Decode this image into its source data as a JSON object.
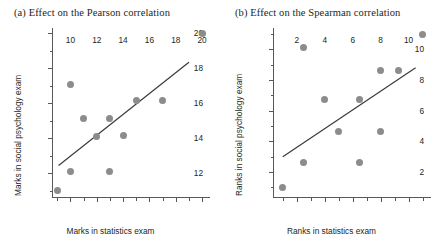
{
  "figure": {
    "background": "#ffffff",
    "point_color": "#8c8c8c",
    "axis_color": "#58595b",
    "line_color": "#3b3b3b"
  },
  "chart_data": [
    {
      "type": "scatter",
      "panel": "a",
      "title": "(a) Effect on the Pearson correlation",
      "xlabel": "Marks in statistics exam",
      "ylabel": "Marks in social psychology exam",
      "xlim": [
        8.6,
        20.6
      ],
      "ylim": [
        10.6,
        20.3
      ],
      "xticks": [
        10,
        12,
        14,
        16,
        18,
        20
      ],
      "xticklabels": [
        "10",
        "12",
        "14",
        "16",
        "18",
        "20"
      ],
      "yticks": [
        12,
        14,
        16,
        18,
        20
      ],
      "yticklabels": [
        "12",
        "14",
        "16",
        "18",
        "20"
      ],
      "x_minor_ticks": [
        9,
        11,
        13,
        15,
        17,
        19
      ],
      "y_minor_ticks": [
        11,
        13,
        15,
        17,
        19
      ],
      "grid": false,
      "legend": false,
      "points": [
        {
          "x": 9,
          "y": 11.0
        },
        {
          "x": 10,
          "y": 12.1
        },
        {
          "x": 10,
          "y": 17.1
        },
        {
          "x": 11,
          "y": 15.15
        },
        {
          "x": 12,
          "y": 14.1
        },
        {
          "x": 13,
          "y": 15.15
        },
        {
          "x": 13,
          "y": 12.1
        },
        {
          "x": 14,
          "y": 14.15
        },
        {
          "x": 15,
          "y": 16.15
        },
        {
          "x": 17,
          "y": 16.15
        },
        {
          "x": 20,
          "y": 20.0
        }
      ],
      "fit_line": {
        "x1": 9.1,
        "y1": 12.45,
        "x2": 19.0,
        "y2": 18.35
      }
    },
    {
      "type": "scatter",
      "panel": "b",
      "title": "(b) Effect on the Spearman correlation",
      "xlabel": "Ranks in statistics exam",
      "ylabel": "Ranks in social psychology exam",
      "xlim": [
        0.3,
        11.6
      ],
      "ylim": [
        0.3,
        11.4
      ],
      "xticks": [
        2,
        4,
        6,
        8,
        10
      ],
      "xticklabels": [
        "2",
        "4",
        "6",
        "8",
        "10"
      ],
      "yticks": [
        2,
        4,
        6,
        8,
        10
      ],
      "yticklabels": [
        "2",
        "4",
        "6",
        "8",
        "10"
      ],
      "x_minor_ticks": [
        1,
        3,
        5,
        7,
        9,
        11
      ],
      "y_minor_ticks": [
        1,
        3,
        5,
        7,
        9,
        11
      ],
      "grid": false,
      "legend": false,
      "points": [
        {
          "x": 1.0,
          "y": 1.0
        },
        {
          "x": 2.5,
          "y": 2.65
        },
        {
          "x": 2.5,
          "y": 10.1
        },
        {
          "x": 4.0,
          "y": 6.7
        },
        {
          "x": 5.0,
          "y": 4.65
        },
        {
          "x": 6.5,
          "y": 6.7
        },
        {
          "x": 6.5,
          "y": 2.65
        },
        {
          "x": 8.0,
          "y": 4.65
        },
        {
          "x": 8.0,
          "y": 8.65
        },
        {
          "x": 9.3,
          "y": 8.65
        },
        {
          "x": 11.0,
          "y": 11.0
        }
      ],
      "fit_line": {
        "x1": 1.0,
        "y1": 3.0,
        "x2": 10.5,
        "y2": 8.8
      }
    }
  ]
}
